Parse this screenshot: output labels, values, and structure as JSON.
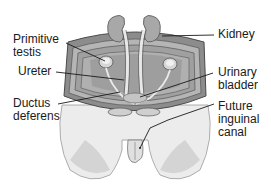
{
  "diagram": {
    "type": "anatomical-illustration",
    "labels": {
      "primitive_testis": "Primitive\ntestis",
      "ureter": "Ureter",
      "ductus_deferens": "Ductus\ndeferens",
      "kidney": "Kidney",
      "urinary_bladder": "Urinary\nbladder",
      "future_inguinal_canal": "Future\ninguinal\ncanal"
    },
    "colors": {
      "tissue_light": "#e6e6e6",
      "tissue_mid": "#c8c8c8",
      "tissue_dark": "#9a9a9a",
      "kidney": "#a8a8a8",
      "outline": "#4a4a4a",
      "leader_line": "#1a1a1a"
    }
  }
}
